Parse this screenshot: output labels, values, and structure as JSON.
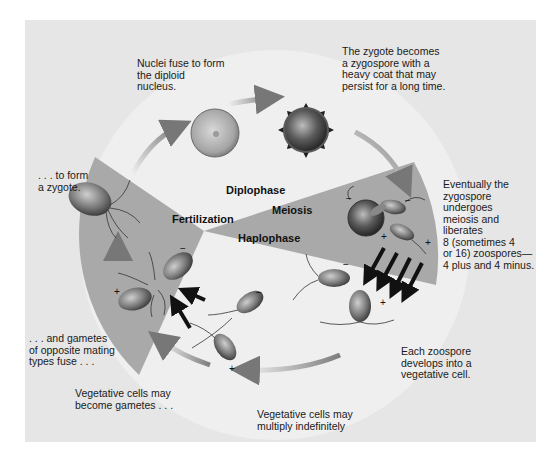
{
  "diagram": {
    "phases": {
      "diplophase": "Diplophase",
      "haplophase": "Haplophase",
      "meiosis": "Meiosis",
      "fertilization": "Fertilization"
    },
    "annotations": {
      "nuclei_fuse": "Nuclei fuse to form\nthe diploid\nnucleus.",
      "zygospore": "The zygote becomes\na zygospore with a\nheavy coat that may\npersist for a long time.",
      "meiosis_desc": "Eventually the\nzygospore\nundergoes\nmeiosis and\nliberates\n8 (sometimes 4\nor 16) zoospores—\n4 plus and 4 minus.",
      "zoospore_develops": "Each zoospore\ndevelops into a\nvegetative cell.",
      "multiply": "Vegetative cells may\nmultiply indefinitely",
      "become_gametes": "Vegetative cells may\nbecome gametes . . .",
      "gametes_fuse": ". . . and gametes\nof opposite mating\ntypes fuse . . .",
      "form_zygote": ". . . to form\na zygote."
    },
    "mating_signs": {
      "plus": "+",
      "minus": "−"
    },
    "colors": {
      "background_panel": "#e6e6e6",
      "circle_light": "#efefef",
      "wedge_gray": "#a9a9a9",
      "text": "#1a1a1a"
    }
  }
}
